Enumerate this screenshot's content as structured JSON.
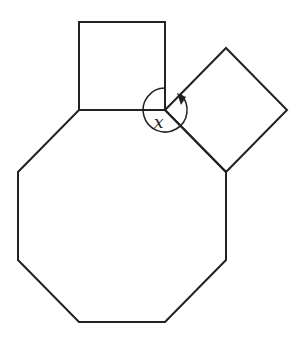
{
  "diagram": {
    "stroke_color": "#222222",
    "background": "#ffffff",
    "octagon": {
      "points": [
        [
          79,
          110
        ],
        [
          165,
          110
        ],
        [
          226,
          172
        ],
        [
          226,
          260
        ],
        [
          165,
          322
        ],
        [
          79,
          322
        ],
        [
          18,
          260
        ],
        [
          18,
          172
        ]
      ]
    },
    "top_square": {
      "points": [
        [
          79,
          110
        ],
        [
          79,
          22
        ],
        [
          165,
          22
        ],
        [
          165,
          110
        ]
      ]
    },
    "tilted_square": {
      "points": [
        [
          165,
          110
        ],
        [
          226,
          48
        ],
        [
          287,
          110
        ],
        [
          226,
          172
        ]
      ]
    },
    "angle": {
      "label": "x",
      "vertex": [
        165,
        110
      ],
      "radius": 22,
      "from": "top-square edge (up)",
      "to": "tilted-square edge (up-right)",
      "direction": "reflex, counterclockwise with arrowhead"
    }
  }
}
